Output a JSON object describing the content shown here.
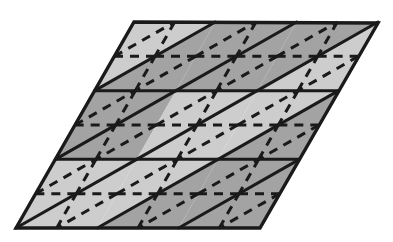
{
  "figure": {
    "name": "triangular-lattice-rhombus",
    "title": "Rhombus subdivided into triangular lattice with dashed medial subdivision",
    "canvas": {
      "width": 393,
      "height": 242,
      "background": "#ffffff"
    }
  },
  "colors": {
    "background": "#ffffff",
    "fill_light": "#cdcdcd",
    "fill_dark": "#a3a3a3",
    "stroke_solid": "#1a1a1a",
    "stroke_dashed": "#1a1a1a"
  },
  "style": {
    "solid_stroke_width": 3.0,
    "outline_stroke_width": 3.4,
    "dashed_stroke_width": 3.0,
    "dash_pattern": "9 7"
  },
  "geometry": {
    "description": "Parallelogram (rhombus) with corners top-left, top-right, bottom-right, bottom-left. Divided into a 3x3 grid of unit rhombi; each unit rhombus split by a solid diagonal into two equilateral triangles. Each large triangle further subdivided by dashed midpoint lines into four medial triangles.",
    "corners": {
      "top_left": [
        134,
        22
      ],
      "top_right": [
        378,
        23
      ],
      "bottom_right": [
        260,
        228
      ],
      "bottom_left": [
        16,
        228
      ]
    },
    "rows": 3,
    "cols": 3,
    "row_y": [
      22,
      90.67,
      159.33,
      228
    ],
    "col_step_x": 81.33,
    "row_shift_x": -39.33,
    "horizontal_lines": [
      {
        "name": "row-line-top",
        "y": 22
      },
      {
        "name": "row-line-1",
        "y": 90.67
      },
      {
        "name": "row-line-2",
        "y": 159.33
      },
      {
        "name": "row-line-bottom",
        "y": 228
      }
    ]
  },
  "cells": [
    {
      "row": 0,
      "col": 0,
      "up_fill": "light",
      "down_fill": "dark"
    },
    {
      "row": 0,
      "col": 1,
      "up_fill": "dark",
      "down_fill": "dark"
    },
    {
      "row": 0,
      "col": 2,
      "up_fill": "dark",
      "down_fill": "light"
    },
    {
      "row": 1,
      "col": 0,
      "up_fill": "dark",
      "down_fill": "dark"
    },
    {
      "row": 1,
      "col": 1,
      "up_fill": "light",
      "down_fill": "light"
    },
    {
      "row": 1,
      "col": 2,
      "up_fill": "light",
      "down_fill": "dark"
    },
    {
      "row": 2,
      "col": 0,
      "up_fill": "light",
      "down_fill": "light"
    },
    {
      "row": 2,
      "col": 1,
      "up_fill": "light",
      "down_fill": "dark"
    },
    {
      "row": 2,
      "col": 2,
      "up_fill": "dark",
      "down_fill": "dark"
    }
  ],
  "legend": {
    "solid_line_meaning": "primary triangular lattice edges",
    "dashed_line_meaning": "medial (midpoint) subdivision edges"
  }
}
